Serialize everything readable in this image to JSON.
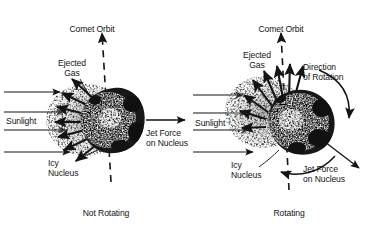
{
  "figure": {
    "background_color": "#ffffff",
    "ink_color": "#141414"
  },
  "panels": [
    {
      "id": "not-rotating",
      "state_label": "Not Rotating",
      "orbit_label": "Comet Orbit",
      "sunlight_label": "Sunlight",
      "ejected_gas_label": "Ejected\nGas",
      "nucleus_label": "Icy\nNucleus",
      "jet_force_label": "Jet Force\non Nucleus",
      "sunlight_ray_count": 4,
      "gas_jet_count": 7,
      "jet_direction": "left (sunward)",
      "net_force_direction": "right (anti-sunward)",
      "rotation_arcs": 0
    },
    {
      "id": "rotating",
      "state_label": "Rotating",
      "orbit_label": "Comet Orbit",
      "sunlight_label": "Sunlight",
      "ejected_gas_label": "Ejected\nGas",
      "nucleus_label": "Icy\nNucleus",
      "jet_force_label": "Jet Force\non Nucleus",
      "rotation_label": "Direction\nof Rotation",
      "sunlight_ray_count": 4,
      "gas_jet_count": 8,
      "jet_direction": "upper-left (lagging sunward)",
      "net_force_direction": "lower-right",
      "rotation_arcs": 2
    }
  ]
}
